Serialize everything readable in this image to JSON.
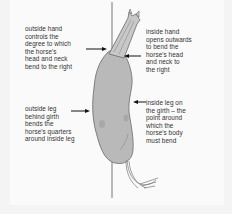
{
  "diagram": {
    "labels": {
      "outside_hand": "outside hand\ncontrols the\ndegree to which\nthe horse's\nhead and neck\nbend to the right",
      "outside_leg": "outside leg\nbehind girth\nbends the\nhorse's quarters\naround inside leg",
      "inside_hand": "inside hand\nopens outwards\nto bend the\nhorse's head\nand neck to\nthe right",
      "inside_leg": "inside leg on\nthe girth – the\npoint around\nwhich the\nhorse's body\nmust bend"
    },
    "colors": {
      "background": "#fafafa",
      "horse_fill": "#b9b9b9",
      "horse_outline": "#6a6a6a",
      "line": "#555555",
      "text": "#333333",
      "arrow": "#111111"
    }
  }
}
